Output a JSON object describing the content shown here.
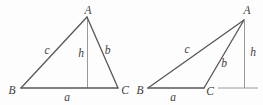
{
  "figure": {
    "type": "geometry-diagram",
    "colors": {
      "background": "#fdfdfd",
      "line": "#57575a",
      "altitude_line": "#8f8f8f",
      "label": "#3f3f3f"
    },
    "left_triangle": {
      "vertex_top": "A",
      "vertex_bottom_left": "B",
      "vertex_bottom_right": "C",
      "side_left": "c",
      "side_right": "b",
      "side_base": "a",
      "altitude": "h"
    },
    "right_triangle": {
      "vertex_top": "A",
      "vertex_bottom_left": "B",
      "vertex_bottom_right": "C",
      "side_left": "c",
      "side_right": "b",
      "side_base": "a",
      "altitude": "h"
    }
  }
}
